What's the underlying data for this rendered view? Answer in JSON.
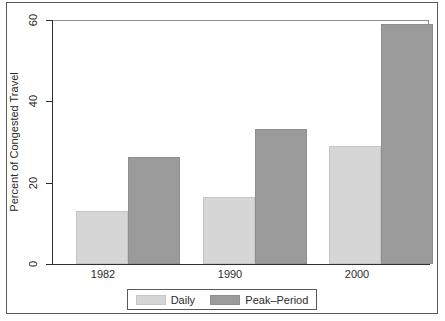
{
  "chart_data": {
    "type": "bar",
    "title": "",
    "xlabel": "",
    "ylabel": "Percent of Congested Travel",
    "categories": [
      "1982",
      "1990",
      "2000"
    ],
    "series": [
      {
        "name": "Daily",
        "values": [
          13,
          16.5,
          29
        ],
        "color": "#d6d6d6"
      },
      {
        "name": "Peak-Period",
        "values": [
          26.3,
          33.2,
          59
        ],
        "color": "#9b9b9b"
      }
    ],
    "ylim": [
      0,
      60
    ],
    "yticks": [
      0,
      20,
      40,
      60
    ],
    "ytick_labels": [
      "0",
      "20",
      "40",
      "60"
    ],
    "grid": false,
    "legend_position": "bottom"
  },
  "axis": {
    "y_label": "Percent of Congested Travel",
    "y_tick_0": "0",
    "y_tick_1": "20",
    "y_tick_2": "40",
    "y_tick_3": "60",
    "x_tick_0": "1982",
    "x_tick_1": "1990",
    "x_tick_2": "2000"
  },
  "legend": {
    "daily_label": "Daily",
    "peak_label": "Peak–Period"
  },
  "title_remnant": ""
}
